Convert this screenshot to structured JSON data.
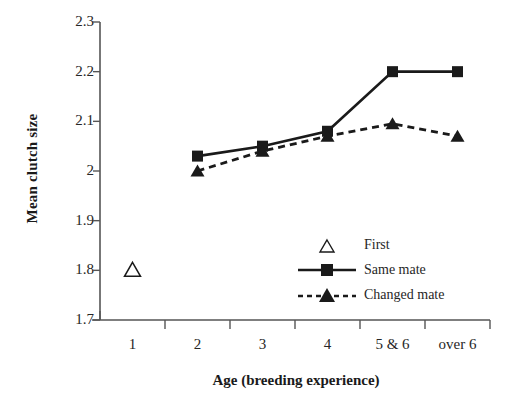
{
  "chart_data": {
    "type": "line",
    "title": "",
    "xlabel": "Age (breeding experience)",
    "ylabel": "Mean clutch size",
    "categories": [
      "1",
      "2",
      "3",
      "4",
      "5 & 6",
      "over 6"
    ],
    "ylim": [
      1.7,
      2.3
    ],
    "yticks": [
      "1.7",
      "1.8",
      "1.9",
      "2",
      "2.1",
      "2.2",
      "2.3"
    ],
    "ytick_values": [
      1.7,
      1.8,
      1.9,
      2.0,
      2.1,
      2.2,
      2.3
    ],
    "grid": false,
    "legend_position": "inside-center-right",
    "series": [
      {
        "name": "First",
        "marker": "open-triangle",
        "line": "none",
        "color": "#1a1a1a",
        "x": [
          "1"
        ],
        "values": [
          1.8
        ]
      },
      {
        "name": "Same mate",
        "marker": "filled-square",
        "line": "solid",
        "color": "#1a1a1a",
        "x": [
          "2",
          "3",
          "4",
          "5 & 6",
          "over 6"
        ],
        "values": [
          2.03,
          2.05,
          2.08,
          2.2,
          2.2
        ]
      },
      {
        "name": "Changed mate",
        "marker": "filled-triangle",
        "line": "dashed",
        "color": "#1a1a1a",
        "x": [
          "2",
          "3",
          "4",
          "5 & 6",
          "over 6"
        ],
        "values": [
          2.0,
          2.04,
          2.07,
          2.095,
          2.07
        ]
      }
    ]
  },
  "legend": {
    "items": [
      {
        "label": "First",
        "key": "open-triangle-key"
      },
      {
        "label": "Same mate",
        "key": "solid-line-square-key"
      },
      {
        "label": "Changed mate",
        "key": "dashed-line-triangle-key"
      }
    ]
  },
  "colors": {
    "ink": "#1a1a1a",
    "axis": "#555555",
    "background": "#ffffff"
  }
}
